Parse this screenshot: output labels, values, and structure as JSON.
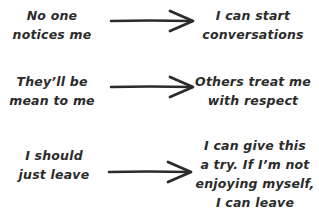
{
  "rows": [
    {
      "from": [
        "No one",
        "notices me"
      ],
      "to": [
        "I can start",
        "conversations"
      ]
    },
    {
      "from": [
        "They’ll be",
        "mean to me"
      ],
      "to": [
        "Others treat me",
        "with respect"
      ]
    },
    {
      "from": [
        "I should",
        "just leave"
      ],
      "to": [
        "I can give this",
        "a try. If I’m not",
        "enjoying myself,",
        "I can leave"
      ]
    }
  ],
  "colors": {
    "ink": "#2b2b2b",
    "background": "#ffffff"
  }
}
